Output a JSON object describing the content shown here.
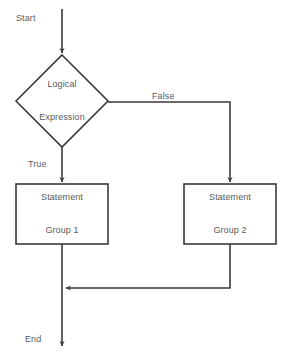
{
  "diagram": {
    "type": "flowchart",
    "canvas": {
      "width": 286,
      "height": 361,
      "background": "#ffffff"
    },
    "style": {
      "line_color": "#3a3a3a",
      "text_color": "#5a5a5a",
      "shape_fill": "#ffffff",
      "stroke_width": 1.6,
      "font_size_px": 9
    },
    "terminals": {
      "start_label": "Start",
      "end_label": "End"
    },
    "nodes": [
      {
        "id": "decision",
        "shape": "diamond",
        "label_line_1": "Logical",
        "label_line_2": "Expression",
        "cx": 62,
        "cy": 101,
        "half_width": 46,
        "half_height": 46
      },
      {
        "id": "statement_group_1",
        "shape": "rectangle",
        "label_line_1": "Statement",
        "label_line_2": "Group 1",
        "x": 16,
        "y": 184,
        "width": 92,
        "height": 60
      },
      {
        "id": "statement_group_2",
        "shape": "rectangle",
        "label_line_1": "Statement",
        "label_line_2": "Group 2",
        "x": 184,
        "y": 184,
        "width": 92,
        "height": 60
      }
    ],
    "edges": [
      {
        "id": "start-to-decision",
        "label": "",
        "from": "start",
        "to": "decision"
      },
      {
        "id": "decision-true",
        "label": "True",
        "from": "decision",
        "to": "statement_group_1"
      },
      {
        "id": "decision-false",
        "label": "False",
        "from": "decision",
        "to": "statement_group_2"
      },
      {
        "id": "group1-to-merge",
        "label": "",
        "from": "statement_group_1",
        "to": "merge"
      },
      {
        "id": "group2-to-merge",
        "label": "",
        "from": "statement_group_2",
        "to": "merge"
      },
      {
        "id": "merge-to-end",
        "label": "",
        "from": "merge",
        "to": "end"
      }
    ]
  }
}
